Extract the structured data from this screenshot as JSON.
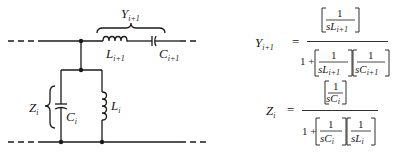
{
  "circuit": {
    "series_branch_label": "Y",
    "series_branch_sub": "i+1",
    "series_inductor_label": "L",
    "series_inductor_sub": "i+1",
    "series_capacitor_label": "C",
    "series_capacitor_sub": "i+1",
    "shunt_branch_label": "Z",
    "shunt_branch_sub": "i",
    "shunt_capacitor_label": "C",
    "shunt_capacitor_sub": "i",
    "shunt_inductor_label": "L",
    "shunt_inductor_sub": "i"
  },
  "equations": {
    "y": {
      "lhs": "Y",
      "lhs_sub": "i+1",
      "equals": "=",
      "num_one": "1",
      "num_den": "sL",
      "num_den_sub": "i+1",
      "den_one": "1 +",
      "den_t1_one": "1",
      "den_t1": "sL",
      "den_t1_sub": "i+1",
      "den_t2_one": "1",
      "den_t2": "sC",
      "den_t2_sub": "i+1"
    },
    "z": {
      "lhs": "Z",
      "lhs_sub": "i",
      "equals": "=",
      "num_one": "1",
      "num_den": "sC",
      "num_den_sub": "i",
      "den_one": "1 +",
      "den_t1_one": "1",
      "den_t1": "sC",
      "den_t1_sub": "i",
      "den_t2_one": "1",
      "den_t2": "sL",
      "den_t2_sub": "i"
    }
  }
}
